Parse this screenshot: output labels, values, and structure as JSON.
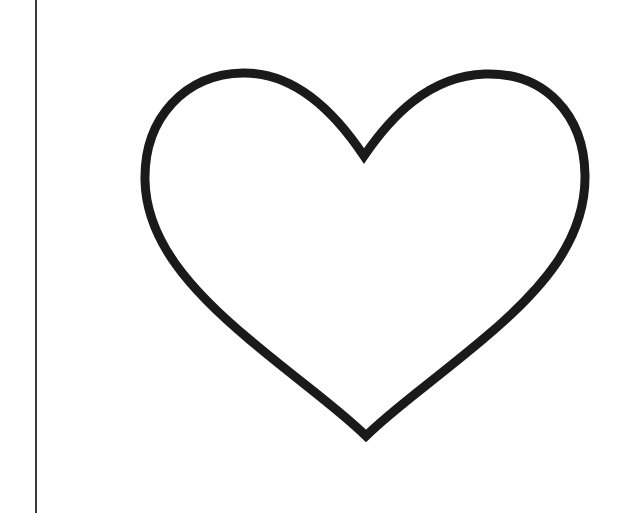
{
  "image": {
    "subject": "heart outline",
    "stroke_color": "#1a1a1a",
    "background_color": "#ffffff",
    "divider_color": "#3a3a3a"
  }
}
